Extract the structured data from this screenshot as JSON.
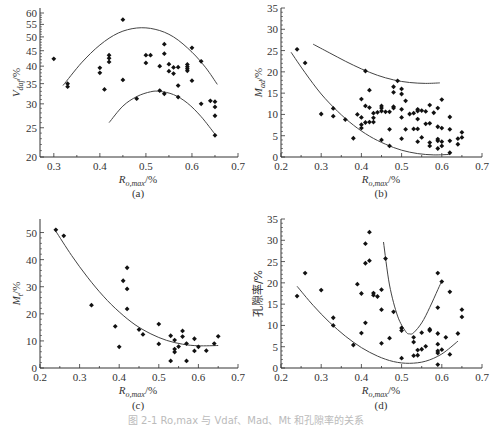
{
  "figure": {
    "caption": "图 2-1  Ro,max 与 Vdaf、Mad、Mt 和孔隙率的关系"
  },
  "chart_data": [
    {
      "id": "a",
      "panel_label": "(a)",
      "type": "scatter",
      "xlabel": "Ro,max/%",
      "ylabel": "Vdaf/%",
      "xlim": [
        0.27,
        0.7
      ],
      "ylim": [
        20,
        60
      ],
      "yscale": "log",
      "xticks": [
        0.3,
        0.4,
        0.5,
        0.6,
        0.7
      ],
      "yticks": [
        20,
        25,
        30,
        35,
        40,
        45,
        50,
        55,
        60
      ],
      "grid": false,
      "points": [
        [
          0.3,
          42.3
        ],
        [
          0.33,
          35.0
        ],
        [
          0.33,
          34.2
        ],
        [
          0.4,
          39.5
        ],
        [
          0.4,
          38.0
        ],
        [
          0.41,
          33.5
        ],
        [
          0.42,
          43.5
        ],
        [
          0.42,
          42.5
        ],
        [
          0.42,
          41.3
        ],
        [
          0.45,
          57.0
        ],
        [
          0.45,
          36.0
        ],
        [
          0.48,
          31.2
        ],
        [
          0.5,
          43.5
        ],
        [
          0.5,
          41.0
        ],
        [
          0.51,
          43.5
        ],
        [
          0.53,
          40.0
        ],
        [
          0.53,
          33.2
        ],
        [
          0.54,
          47.3
        ],
        [
          0.54,
          44.0
        ],
        [
          0.54,
          32.4
        ],
        [
          0.55,
          40.6
        ],
        [
          0.55,
          38.5
        ],
        [
          0.56,
          39.6
        ],
        [
          0.56,
          37.8
        ],
        [
          0.57,
          39.7
        ],
        [
          0.57,
          34.5
        ],
        [
          0.57,
          31.6
        ],
        [
          0.59,
          40.5
        ],
        [
          0.59,
          39.8
        ],
        [
          0.59,
          39.2
        ],
        [
          0.59,
          38.6
        ],
        [
          0.6,
          46.0
        ],
        [
          0.6,
          35.8
        ],
        [
          0.62,
          41.5
        ],
        [
          0.62,
          30.0
        ],
        [
          0.64,
          30.7
        ],
        [
          0.65,
          30.5
        ],
        [
          0.65,
          29.3
        ],
        [
          0.65,
          27.4
        ],
        [
          0.65,
          23.6
        ]
      ],
      "curves": [
        {
          "name": "upper envelope",
          "x": [
            0.32,
            0.36,
            0.4,
            0.44,
            0.48,
            0.52,
            0.56,
            0.6,
            0.63,
            0.655
          ],
          "y": [
            34.5,
            41.0,
            47.0,
            51.5,
            53.5,
            53.0,
            50.0,
            44.5,
            39.5,
            34.8
          ]
        },
        {
          "name": "lower envelope",
          "x": [
            0.42,
            0.45,
            0.48,
            0.51,
            0.53,
            0.56,
            0.59,
            0.62,
            0.65
          ],
          "y": [
            26.0,
            29.5,
            31.7,
            32.9,
            33.0,
            32.2,
            30.2,
            27.2,
            23.8
          ]
        }
      ]
    },
    {
      "id": "b",
      "panel_label": "(b)",
      "type": "scatter",
      "xlabel": "Ro,max/%",
      "ylabel": "Mad/%",
      "xlim": [
        0.2,
        0.7
      ],
      "ylim": [
        0,
        35
      ],
      "xticks": [
        0.2,
        0.3,
        0.4,
        0.5,
        0.6,
        0.7
      ],
      "yticks": [
        0,
        5,
        10,
        15,
        20,
        25,
        30,
        35
      ],
      "grid": false,
      "points": [
        [
          0.24,
          25.3
        ],
        [
          0.26,
          22.1
        ],
        [
          0.3,
          10.1
        ],
        [
          0.33,
          11.4
        ],
        [
          0.33,
          9.6
        ],
        [
          0.36,
          8.8
        ],
        [
          0.38,
          4.4
        ],
        [
          0.39,
          10.0
        ],
        [
          0.4,
          13.6
        ],
        [
          0.4,
          9.3
        ],
        [
          0.4,
          7.6
        ],
        [
          0.4,
          6.8
        ],
        [
          0.41,
          20.2
        ],
        [
          0.41,
          12.0
        ],
        [
          0.41,
          8.1
        ],
        [
          0.42,
          15.7
        ],
        [
          0.42,
          11.6
        ],
        [
          0.42,
          8.2
        ],
        [
          0.43,
          10.3
        ],
        [
          0.43,
          9.2
        ],
        [
          0.43,
          8.2
        ],
        [
          0.44,
          10.5
        ],
        [
          0.45,
          12.0
        ],
        [
          0.45,
          11.5
        ],
        [
          0.45,
          10.8
        ],
        [
          0.45,
          4.0
        ],
        [
          0.46,
          10.6
        ],
        [
          0.47,
          10.6
        ],
        [
          0.47,
          6.5
        ],
        [
          0.47,
          2.6
        ],
        [
          0.48,
          16.5
        ],
        [
          0.48,
          15.2
        ],
        [
          0.48,
          11.8
        ],
        [
          0.48,
          11.5
        ],
        [
          0.49,
          17.9
        ],
        [
          0.5,
          16.0
        ],
        [
          0.5,
          14.8
        ],
        [
          0.5,
          11.2
        ],
        [
          0.5,
          9.3
        ],
        [
          0.5,
          4.3
        ],
        [
          0.51,
          13.2
        ],
        [
          0.51,
          6.5
        ],
        [
          0.52,
          10.1
        ],
        [
          0.53,
          10.3
        ],
        [
          0.53,
          6.6
        ],
        [
          0.54,
          11.2
        ],
        [
          0.54,
          10.8
        ],
        [
          0.54,
          8.9
        ],
        [
          0.54,
          6.6
        ],
        [
          0.54,
          3.6
        ],
        [
          0.55,
          10.9
        ],
        [
          0.55,
          4.6
        ],
        [
          0.56,
          10.7
        ],
        [
          0.56,
          7.8
        ],
        [
          0.57,
          12.2
        ],
        [
          0.57,
          7.9
        ],
        [
          0.57,
          3.4
        ],
        [
          0.57,
          2.6
        ],
        [
          0.58,
          10.4
        ],
        [
          0.59,
          11.5
        ],
        [
          0.59,
          7.1
        ],
        [
          0.59,
          4.2
        ],
        [
          0.59,
          3.8
        ],
        [
          0.59,
          2.0
        ],
        [
          0.6,
          13.5
        ],
        [
          0.6,
          6.8
        ],
        [
          0.6,
          3.6
        ],
        [
          0.6,
          2.6
        ],
        [
          0.62,
          9.4
        ],
        [
          0.62,
          6.5
        ],
        [
          0.62,
          3.8
        ],
        [
          0.62,
          1.0
        ],
        [
          0.64,
          4.3
        ],
        [
          0.64,
          3.0
        ],
        [
          0.65,
          5.8
        ],
        [
          0.65,
          4.6
        ]
      ],
      "curves": [
        {
          "name": "upper envelope",
          "x": [
            0.28,
            0.32,
            0.36,
            0.4,
            0.44,
            0.48,
            0.52,
            0.56,
            0.595
          ],
          "y": [
            26.5,
            24.5,
            22.5,
            20.7,
            19.2,
            18.1,
            17.5,
            17.3,
            17.4
          ]
        },
        {
          "name": "lower envelope",
          "x": [
            0.225,
            0.26,
            0.3,
            0.34,
            0.38,
            0.42,
            0.46,
            0.5,
            0.54,
            0.58,
            0.62
          ],
          "y": [
            24.6,
            19.8,
            14.8,
            10.8,
            7.5,
            4.9,
            3.0,
            1.6,
            0.8,
            0.5,
            0.6
          ]
        }
      ]
    },
    {
      "id": "c",
      "panel_label": "(c)",
      "type": "scatter",
      "xlabel": "Ro,max/%",
      "ylabel": "Mt/%",
      "xlim": [
        0.2,
        0.7
      ],
      "ylim": [
        0,
        55
      ],
      "xticks": [
        0.2,
        0.3,
        0.4,
        0.5,
        0.6,
        0.7
      ],
      "yticks": [
        0,
        10,
        20,
        30,
        40,
        50
      ],
      "grid": false,
      "points": [
        [
          0.24,
          51.0
        ],
        [
          0.26,
          48.8
        ],
        [
          0.33,
          23.2
        ],
        [
          0.39,
          15.4
        ],
        [
          0.4,
          7.8
        ],
        [
          0.41,
          32.2
        ],
        [
          0.42,
          37.0
        ],
        [
          0.42,
          29.2
        ],
        [
          0.42,
          21.8
        ],
        [
          0.45,
          14.2
        ],
        [
          0.46,
          12.4
        ],
        [
          0.5,
          16.2
        ],
        [
          0.5,
          8.9
        ],
        [
          0.53,
          11.9
        ],
        [
          0.53,
          2.6
        ],
        [
          0.54,
          10.3
        ],
        [
          0.54,
          7.0
        ],
        [
          0.54,
          5.9
        ],
        [
          0.55,
          7.9
        ],
        [
          0.56,
          13.7
        ],
        [
          0.56,
          11.6
        ],
        [
          0.57,
          9.0
        ],
        [
          0.57,
          2.6
        ],
        [
          0.59,
          10.8
        ],
        [
          0.59,
          6.3
        ],
        [
          0.6,
          7.8
        ],
        [
          0.62,
          6.4
        ],
        [
          0.64,
          9.0
        ],
        [
          0.65,
          11.7
        ]
      ],
      "curves": [
        {
          "name": "fit",
          "x": [
            0.24,
            0.28,
            0.32,
            0.36,
            0.4,
            0.44,
            0.48,
            0.52,
            0.56,
            0.6,
            0.65
          ],
          "y": [
            50.5,
            41.5,
            33.5,
            26.5,
            20.7,
            16.0,
            12.6,
            10.2,
            8.8,
            8.2,
            8.3
          ]
        }
      ]
    },
    {
      "id": "d",
      "panel_label": "(d)",
      "type": "scatter",
      "xlabel": "Ro,max/%",
      "ylabel": "孔隙率/%",
      "xlim": [
        0.2,
        0.7
      ],
      "ylim": [
        0,
        35
      ],
      "xticks": [
        0.2,
        0.3,
        0.4,
        0.5,
        0.6,
        0.7
      ],
      "yticks": [
        0,
        5,
        10,
        15,
        20,
        25,
        30,
        35
      ],
      "grid": false,
      "points": [
        [
          0.24,
          16.9
        ],
        [
          0.26,
          22.3
        ],
        [
          0.3,
          18.3
        ],
        [
          0.33,
          11.8
        ],
        [
          0.33,
          10.0
        ],
        [
          0.38,
          5.4
        ],
        [
          0.39,
          19.7
        ],
        [
          0.4,
          17.5
        ],
        [
          0.4,
          8.2
        ],
        [
          0.41,
          29.2
        ],
        [
          0.41,
          24.6
        ],
        [
          0.41,
          10.6
        ],
        [
          0.42,
          31.9
        ],
        [
          0.42,
          25.2
        ],
        [
          0.43,
          17.6
        ],
        [
          0.43,
          17.1
        ],
        [
          0.44,
          16.8
        ],
        [
          0.45,
          18.4
        ],
        [
          0.45,
          13.7
        ],
        [
          0.45,
          5.8
        ],
        [
          0.46,
          25.7
        ],
        [
          0.47,
          7.0
        ],
        [
          0.48,
          13.2
        ],
        [
          0.5,
          9.4
        ],
        [
          0.5,
          8.8
        ],
        [
          0.5,
          2.3
        ],
        [
          0.53,
          7.2
        ],
        [
          0.53,
          6.1
        ],
        [
          0.53,
          2.9
        ],
        [
          0.54,
          4.2
        ],
        [
          0.54,
          3.0
        ],
        [
          0.55,
          8.3
        ],
        [
          0.55,
          4.4
        ],
        [
          0.56,
          5.1
        ],
        [
          0.57,
          9.1
        ],
        [
          0.57,
          8.8
        ],
        [
          0.59,
          22.3
        ],
        [
          0.59,
          14.2
        ],
        [
          0.59,
          8.1
        ],
        [
          0.59,
          5.6
        ],
        [
          0.59,
          4.0
        ],
        [
          0.59,
          3.5
        ],
        [
          0.59,
          0.8
        ],
        [
          0.6,
          20.3
        ],
        [
          0.6,
          4.3
        ],
        [
          0.61,
          7.2
        ],
        [
          0.62,
          17.9
        ],
        [
          0.62,
          3.2
        ],
        [
          0.64,
          8.1
        ],
        [
          0.65,
          13.7
        ],
        [
          0.65,
          12.0
        ]
      ],
      "curves": [
        {
          "name": "lower envelope",
          "x": [
            0.24,
            0.28,
            0.32,
            0.36,
            0.4,
            0.44,
            0.48,
            0.52,
            0.56,
            0.6,
            0.64
          ],
          "y": [
            19.2,
            14.7,
            10.8,
            7.5,
            4.8,
            2.8,
            1.5,
            1.1,
            1.6,
            3.3,
            6.3
          ]
        },
        {
          "name": "upper envelope",
          "x": [
            0.455,
            0.47,
            0.49,
            0.51,
            0.52,
            0.53,
            0.55,
            0.57,
            0.59,
            0.6
          ],
          "y": [
            29.6,
            19.5,
            12.2,
            8.6,
            8.0,
            8.3,
            10.6,
            14.2,
            18.4,
            20.4
          ]
        }
      ]
    }
  ]
}
